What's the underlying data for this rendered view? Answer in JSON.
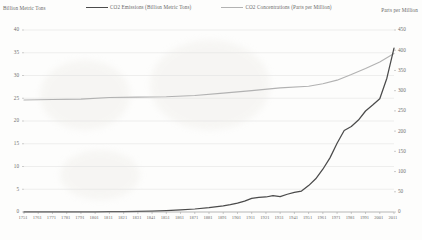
{
  "chart_data": {
    "type": "line",
    "title": "",
    "subtitle": "",
    "xlabel": "",
    "ylabel": "Billion Metric Tons",
    "y2label": "Parts per Million",
    "grid": true,
    "legend_position": "top",
    "xlim": [
      1751,
      2011
    ],
    "ylim": [
      0,
      40
    ],
    "y2lim": [
      0,
      450
    ],
    "yticks": [
      0,
      5,
      10,
      15,
      20,
      25,
      30,
      35,
      40
    ],
    "y2ticks": [
      0,
      50,
      100,
      150,
      200,
      250,
      300,
      350,
      400,
      450
    ],
    "xticks": [
      1751,
      1761,
      1771,
      1781,
      1791,
      1801,
      1811,
      1821,
      1831,
      1841,
      1851,
      1861,
      1871,
      1881,
      1891,
      1901,
      1911,
      1921,
      1931,
      1941,
      1951,
      1961,
      1971,
      1981,
      1991,
      2001,
      2011
    ],
    "series": [
      {
        "name": "CO2 Emissions (Billion Metric Tons)",
        "axis": "left",
        "color": "#4b4b4b",
        "x": [
          1751,
          1761,
          1771,
          1781,
          1791,
          1801,
          1811,
          1821,
          1831,
          1841,
          1851,
          1861,
          1871,
          1881,
          1891,
          1896,
          1901,
          1906,
          1911,
          1916,
          1921,
          1926,
          1931,
          1936,
          1941,
          1946,
          1951,
          1956,
          1961,
          1966,
          1971,
          1976,
          1981,
          1986,
          1991,
          1996,
          2001,
          2006,
          2011
        ],
        "values": [
          0.01,
          0.01,
          0.02,
          0.03,
          0.04,
          0.05,
          0.07,
          0.09,
          0.14,
          0.21,
          0.3,
          0.45,
          0.66,
          0.95,
          1.33,
          1.6,
          1.95,
          2.4,
          3.0,
          3.2,
          3.3,
          3.6,
          3.4,
          3.9,
          4.3,
          4.6,
          5.8,
          7.3,
          9.4,
          11.9,
          15.1,
          17.9,
          18.8,
          20.2,
          22.2,
          23.5,
          24.9,
          29.4,
          36.0
        ]
      },
      {
        "name": "CO2 Concentrations (Parts per Million)",
        "axis": "right",
        "color": "#b2b2b2",
        "x": [
          1751,
          1771,
          1791,
          1811,
          1831,
          1851,
          1871,
          1891,
          1911,
          1931,
          1951,
          1961,
          1971,
          1981,
          1991,
          2001,
          2011
        ],
        "values": [
          277,
          278,
          279,
          283,
          284,
          285,
          288,
          294,
          300,
          307,
          311,
          317,
          326,
          340,
          355,
          371,
          392
        ]
      }
    ]
  },
  "legend": {
    "items": [
      {
        "label": "CO2 Emissions (Billion Metric Tons)",
        "color": "#4b4b4b"
      },
      {
        "label": "CO2 Concentrations (Parts per Million)",
        "color": "#b2b2b2"
      }
    ]
  },
  "axis_titles": {
    "left": "Billion Metric Tons",
    "right": "Parts per Million"
  }
}
